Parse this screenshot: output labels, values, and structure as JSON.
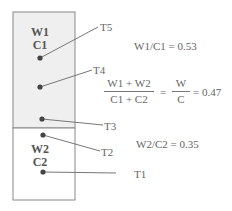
{
  "diagram": {
    "upper_region": {
      "line1": "W1",
      "line2": "C1",
      "fill": "#efefef"
    },
    "lower_region": {
      "line1": "W2",
      "line2": "C2",
      "fill": "#ffffff"
    },
    "points": [
      {
        "label": "T5"
      },
      {
        "label": "T4"
      },
      {
        "label": "T3"
      },
      {
        "label": "T2"
      },
      {
        "label": "T1"
      }
    ],
    "equations": {
      "upper_ratio": "W1/C1 = 0.53",
      "combined": {
        "numerator": "W1 + W2",
        "denominator": "C1 + C2",
        "equals1": "=",
        "w_num": "W",
        "c_den": "C",
        "equals_value": "= 0.47"
      },
      "lower_ratio": "W2/C2 = 0.35"
    },
    "colors": {
      "stroke": "#777777",
      "dot": "#444444",
      "shade": "#efefef"
    }
  }
}
